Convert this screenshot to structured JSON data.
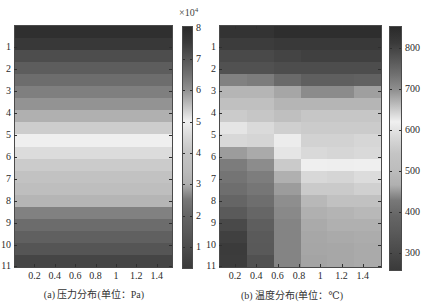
{
  "figure": {
    "panel_a": {
      "caption": "(a) 压力分布(单位：Pa)",
      "colorbar_multiplier": {
        "base": "×10",
        "exponent": "4"
      }
    },
    "panel_b": {
      "caption": "(b) 温度分布(单位：℃)"
    }
  },
  "colormap": {
    "name": "jet-grayscale",
    "stops": [
      [
        0.0,
        "#3a3a3a"
      ],
      [
        0.09,
        "#4d4d4d"
      ],
      [
        0.156,
        "#5a5a5a"
      ],
      [
        0.22,
        "#656565"
      ],
      [
        0.286,
        "#787878"
      ],
      [
        0.35,
        "#b0b0b0"
      ],
      [
        0.415,
        "#bdbdbd"
      ],
      [
        0.48,
        "#c4c4c4"
      ],
      [
        0.545,
        "#d8d8d8"
      ],
      [
        0.61,
        "#f0f0f0"
      ],
      [
        0.675,
        "#c0c0c0"
      ],
      [
        0.74,
        "#909090"
      ],
      [
        0.805,
        "#707070"
      ],
      [
        0.87,
        "#555555"
      ],
      [
        0.935,
        "#3a3a3a"
      ],
      [
        1.0,
        "#2a2a2a"
      ]
    ]
  },
  "chart_data": [
    {
      "type": "heatmap",
      "title": "(a) 压力分布(单位：Pa)",
      "xlabel": "",
      "ylabel": "",
      "xticks": [
        "0.2",
        "0.4",
        "0.6",
        "0.8",
        "1",
        "1.2",
        "1.4"
      ],
      "xtick_values": [
        0.2,
        0.4,
        0.6,
        0.8,
        1.0,
        1.2,
        1.4
      ],
      "yticks": [
        "1",
        "2",
        "3",
        "4",
        "5",
        "6",
        "7",
        "8",
        "9",
        "10",
        "11"
      ],
      "ytick_values": [
        1,
        2,
        3,
        4,
        5,
        6,
        7,
        8,
        9,
        10,
        11
      ],
      "xlim": [
        0,
        1.56
      ],
      "ylim": [
        0,
        11.07
      ],
      "y_direction": "down",
      "grid": false,
      "colorbar": {
        "ticks": [
          "1",
          "2",
          "3",
          "4",
          "5",
          "6",
          "7",
          "8"
        ],
        "tick_values": [
          1,
          2,
          3,
          4,
          5,
          6,
          7,
          8
        ],
        "range": [
          0.3,
          8.05
        ],
        "multiplier": "×10^4",
        "position": "right"
      },
      "note": "values in ×10^4 Pa; field is uniform along x (horizontal bands)",
      "values": [
        [
          7.9
        ],
        [
          7.6
        ],
        [
          7.2
        ],
        [
          6.9
        ],
        [
          6.6
        ],
        [
          6.3
        ],
        [
          6.0
        ],
        [
          5.7
        ],
        [
          5.4
        ],
        [
          5.0
        ],
        [
          4.6
        ],
        [
          4.2
        ],
        [
          3.9
        ],
        [
          3.6
        ],
        [
          3.2
        ],
        [
          2.6
        ],
        [
          2.2
        ],
        [
          1.8
        ],
        [
          1.3
        ],
        [
          0.7
        ]
      ]
    },
    {
      "type": "heatmap",
      "title": "(b) 温度分布(单位：℃)",
      "xlabel": "",
      "ylabel": "",
      "xticks": [
        "0.2",
        "0.4",
        "0.6",
        "0.8",
        "1",
        "1.2",
        "1.4"
      ],
      "xtick_values": [
        0.2,
        0.4,
        0.6,
        0.8,
        1.0,
        1.2,
        1.4
      ],
      "yticks": [
        "1",
        "2",
        "3",
        "4",
        "5",
        "6",
        "7",
        "8",
        "9",
        "10",
        "11"
      ],
      "ytick_values": [
        1,
        2,
        3,
        4,
        5,
        6,
        7,
        8,
        9,
        10,
        11
      ],
      "xlim": [
        0.05,
        1.58
      ],
      "ylim": [
        0,
        11.07
      ],
      "y_direction": "down",
      "grid": false,
      "colorbar": {
        "ticks": [
          "300",
          "400",
          "500",
          "600",
          "700",
          "800"
        ],
        "tick_values": [
          300,
          400,
          500,
          600,
          700,
          800
        ],
        "range": [
          255,
          855
        ],
        "position": "right"
      },
      "note": "values in ℃; 20 rows × 6 columns",
      "values": [
        [
          834,
          834,
          846,
          846,
          846,
          846
        ],
        [
          813,
          813,
          819,
          819,
          819,
          819
        ],
        [
          795,
          795,
          801,
          807,
          807,
          807
        ],
        [
          783,
          783,
          789,
          789,
          789,
          789
        ],
        [
          717,
          723,
          747,
          762,
          762,
          759
        ],
        [
          669,
          669,
          681,
          705,
          705,
          687
        ],
        [
          660,
          660,
          669,
          669,
          669,
          669
        ],
        [
          651,
          655,
          661,
          655,
          655,
          655
        ],
        [
          630,
          639,
          648,
          651,
          651,
          651
        ],
        [
          582,
          576,
          615,
          645,
          645,
          642
        ],
        [
          451,
          461,
          603,
          640,
          642,
          640
        ],
        [
          429,
          440,
          555,
          622,
          618,
          620
        ],
        [
          418,
          430,
          465,
          582,
          576,
          588
        ],
        [
          405,
          423,
          451,
          555,
          555,
          567
        ],
        [
          387,
          405,
          442,
          489,
          525,
          525
        ],
        [
          349,
          390,
          438,
          465,
          477,
          489
        ],
        [
          297,
          363,
          435,
          461,
          465,
          465
        ],
        [
          273,
          349,
          435,
          459,
          461,
          462
        ],
        [
          258,
          345,
          435,
          458,
          459,
          461
        ],
        [
          261,
          321,
          435,
          457,
          459,
          461
        ]
      ]
    }
  ]
}
